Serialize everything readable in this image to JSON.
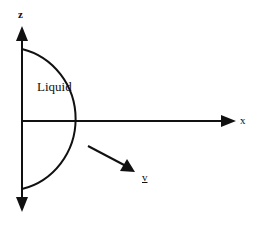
{
  "diagram": {
    "labels": {
      "z_axis": "z",
      "x_axis": "x",
      "region": "Liquid",
      "velocity": "v"
    },
    "colors": {
      "stroke": "#111111",
      "background": "#ffffff"
    },
    "elements": [
      {
        "type": "axis",
        "name": "z-axis",
        "direction": "vertical, double-headed"
      },
      {
        "type": "axis",
        "name": "x-axis",
        "direction": "horizontal, pointing right"
      },
      {
        "type": "arc",
        "name": "liquid-boundary",
        "shape": "semicircle on right of z-axis"
      },
      {
        "type": "vector",
        "name": "velocity-vector",
        "direction": "outward, down-right from boundary"
      }
    ]
  }
}
